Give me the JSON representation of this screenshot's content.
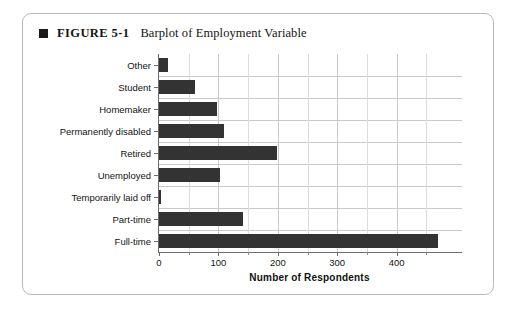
{
  "figure": {
    "marker": "black-square-bullet",
    "label": "FIGURE 5-1",
    "title": "Barplot of Employment Variable"
  },
  "chart_data": {
    "type": "bar",
    "orientation": "horizontal",
    "title": "Barplot of Employment Variable",
    "xlabel": "Number of Respondents",
    "ylabel": "",
    "categories": [
      "Full-time",
      "Part-time",
      "Temporarily laid off",
      "Unemployed",
      "Retired",
      "Permanently disabled",
      "Homemaker",
      "Student",
      "Other"
    ],
    "values": [
      470,
      141,
      4,
      102,
      198,
      109,
      97,
      60,
      15
    ],
    "xlim": [
      0,
      510
    ],
    "xticks": [
      0,
      100,
      200,
      300,
      400
    ],
    "xtick_labels": [
      "0",
      "100",
      "200",
      "300",
      "400"
    ],
    "xminor_ticks": [
      50,
      150,
      250,
      350,
      450
    ],
    "grid": true,
    "grid_axis": "both",
    "bar_color": "#333333",
    "grid_color": "#c9c9c9",
    "axis_color": "#6d6d6d",
    "legend": null
  }
}
